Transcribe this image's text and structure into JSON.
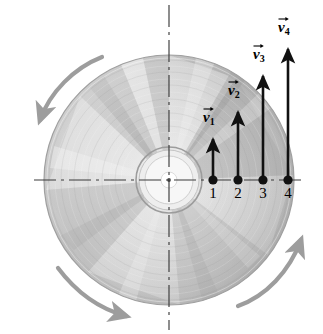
{
  "figure": {
    "colors": {
      "background": "#ffffff",
      "disc_light": "#d8d8d8",
      "disc_mid": "#b9b9b9",
      "disc_dark": "#9a9a9a",
      "axis": "#3a3a3a",
      "vector": "#111111",
      "rotation_arrow": "#9d9d9d",
      "hub_white": "#ffffff"
    },
    "disc": {
      "center_x": 169,
      "center_y": 180,
      "radius": 125,
      "hub_outer_radius": 33,
      "hub_inner_radius": 24,
      "hole_radius": 8
    },
    "axes": [
      {
        "name": "horizontal-centerline",
        "x1": 34,
        "y1": 180,
        "x2": 306,
        "y2": 180
      },
      {
        "name": "vertical-centerline",
        "x1": 169,
        "y1": 5,
        "x2": 169,
        "y2": 330
      }
    ],
    "rotation_arrows": [
      {
        "name": "rotation-arrow-top-left",
        "direction": "counterclockwise-sweep-top-left"
      },
      {
        "name": "rotation-arrow-bottom-left",
        "direction": "sweep-bottom-left"
      },
      {
        "name": "rotation-arrow-right",
        "direction": "sweep-right-upward"
      }
    ],
    "points": [
      {
        "id": "p1",
        "label": "1",
        "x": 213,
        "y": 180,
        "label_x": 206,
        "label_y": 186
      },
      {
        "id": "p2",
        "label": "2",
        "x": 238,
        "y": 180,
        "label_x": 231,
        "label_y": 186
      },
      {
        "id": "p3",
        "label": "3",
        "x": 263,
        "y": 180,
        "label_x": 256,
        "label_y": 186
      },
      {
        "id": "p4",
        "label": "4",
        "x": 288,
        "y": 180,
        "label_x": 281,
        "label_y": 186
      }
    ],
    "vectors": [
      {
        "id": "v1",
        "symbol": "v",
        "subscript": "1",
        "x": 213,
        "tail_y": 180,
        "tip_y": 133,
        "length": 47,
        "label_x": 203,
        "label_y": 110
      },
      {
        "id": "v2",
        "symbol": "v",
        "subscript": "2",
        "x": 238,
        "tail_y": 180,
        "tip_y": 106,
        "length": 74,
        "label_x": 228,
        "label_y": 83
      },
      {
        "id": "v3",
        "symbol": "v",
        "subscript": "3",
        "x": 263,
        "tail_y": 180,
        "tip_y": 70,
        "length": 110,
        "label_x": 253,
        "label_y": 47
      },
      {
        "id": "v4",
        "symbol": "v",
        "subscript": "4",
        "x": 288,
        "tail_y": 180,
        "tip_y": 43,
        "length": 137,
        "label_x": 278,
        "label_y": 20
      }
    ]
  }
}
